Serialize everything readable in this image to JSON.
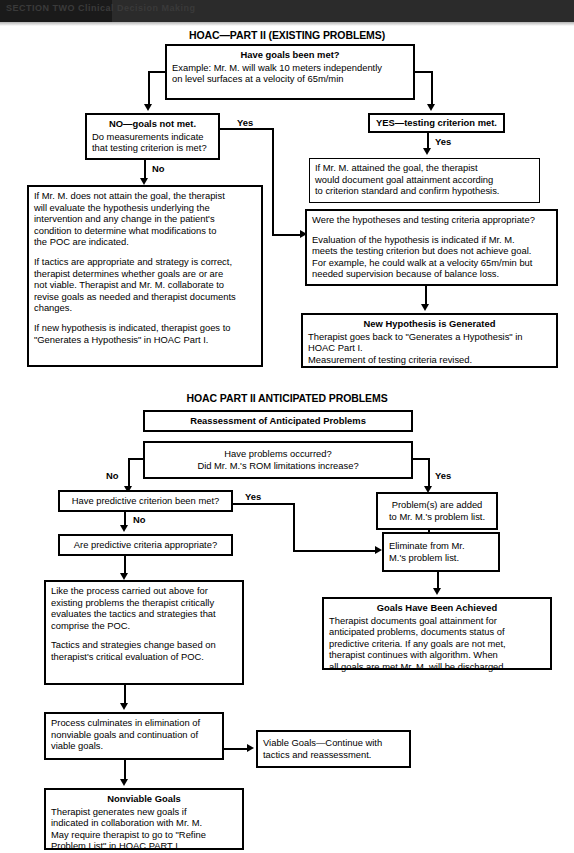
{
  "header": {
    "masthead_text": "SECTION TWO  Clinical Decision Making"
  },
  "part1": {
    "title": "HOAC—PART II (EXISTING PROBLEMS)",
    "goals_met": {
      "heading": "Have goals been met?",
      "line1": "Example: Mr. M. will walk 10 meters independently",
      "line2": "on level surfaces at a velocity of 65m/min"
    },
    "no_goals": {
      "heading": "NO—goals not met.",
      "line1": "Do measurements indicate",
      "line2": "that testing criterion is met?"
    },
    "yes_testing": {
      "heading": "YES—testing criterion met."
    },
    "attained": {
      "line1": "If Mr. M. attained the goal, the therapist",
      "line2": "would document goal attainment according",
      "line3": "to criterion standard and confirm hypothesis."
    },
    "not_attain": {
      "p1l1": "If Mr. M. does not attain the goal, the therapist",
      "p1l2": "will evaluate the hypothesis underlying the",
      "p1l3": "intervention and any change in the patient's",
      "p1l4": "condition to determine what modifications to",
      "p1l5": "the POC are indicated.",
      "p2l1": "If tactics are appropriate and strategy is correct,",
      "p2l2": "therapist determines whether goals are or are",
      "p2l3": "not viable. Therapist and Mr. M. collaborate to",
      "p2l4": "revise goals as needed and therapist documents",
      "p2l5": "changes.",
      "p3l1": "If new hypothesis is indicated, therapist goes to",
      "p3l2": "\"Generates a Hypothesis\" in HOAC Part I."
    },
    "hypotheses_appropriate": {
      "q": "Were the hypotheses and testing criteria appropriate?",
      "l1": "Evaluation of the hypothesis is indicated if Mr. M.",
      "l2": "meets the testing criterion but does not achieve goal.",
      "l3": "For example, he could walk at a velocity 65m/min but",
      "l4": "needed supervision because of balance loss."
    },
    "new_hypothesis": {
      "heading": "New Hypothesis is Generated",
      "l1": "Therapist goes back to \"Generates a Hypothesis\" in",
      "l2": "HOAC Part I.",
      "l3": "Measurement of testing criteria revised."
    },
    "labels": {
      "yes_right_of_no_box": "Yes",
      "no_below_no_box": "No",
      "yes_below_yes_box": "Yes"
    }
  },
  "part2": {
    "title": "HOAC PART II ANTICIPATED PROBLEMS",
    "reassessment": {
      "heading": "Reassessment of Anticipated Problems"
    },
    "problems_occurred": {
      "l1": "Have problems occurred?",
      "l2": "Did Mr. M.'s ROM limitations increase?"
    },
    "predictive_met": {
      "q": "Have predictive criterion been met?"
    },
    "predictive_appropriate": {
      "q": "Are predictive criteria appropriate?"
    },
    "problems_added": {
      "l1": "Problem(s) are added",
      "l2": "to Mr. M.'s problem list."
    },
    "eliminate": {
      "l1": "Eliminate from Mr.",
      "l2": "M.'s problem list."
    },
    "goals_achieved": {
      "heading": "Goals Have Been Achieved",
      "l1": "Therapist documents goal attainment for",
      "l2": "anticipated problems, documents status of",
      "l3": "predictive criteria. If any goals are not met,",
      "l4": "therapist continues with algorithm. When",
      "l5": "all goals are met Mr. M. will be discharged."
    },
    "like_process": {
      "p1l1": "Like the process carried out above for",
      "p1l2": "existing problems the therapist critically",
      "p1l3": "evaluates the tactics and strategies that",
      "p1l4": "comprise the POC.",
      "p2l1": "Tactics and strategies change based on",
      "p2l2": "therapist's critical evaluation of POC."
    },
    "culminates": {
      "l1": "Process culminates in elimination of",
      "l2": "nonviable goals and continuation of",
      "l3": "viable goals."
    },
    "viable_goals": {
      "l1": "Viable Goals—Continue with",
      "l2": "tactics and reassessment."
    },
    "nonviable_goals": {
      "heading": "Nonviable Goals",
      "l1": "Therapist generates new goals if",
      "l2": "indicated in collaboration with Mr. M.",
      "l3": "May require therapist to go to \"Refine",
      "l4": "Problem List\" in HOAC PART I."
    },
    "labels": {
      "no_left": "No",
      "yes_right": "Yes",
      "yes_predictive": "Yes",
      "no_predictive": "No"
    }
  }
}
